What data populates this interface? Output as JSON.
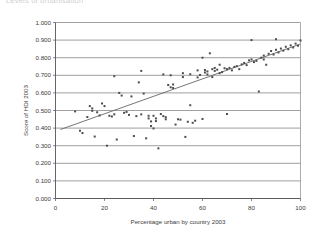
{
  "chart_data": {
    "type": "scatter",
    "title": "Levels of urbanisation",
    "xlabel": "Percentage urban by country 2003",
    "ylabel": "Score of HDI 2003",
    "xlim": [
      0,
      100
    ],
    "ylim": [
      0.0,
      1.0
    ],
    "xticks": [
      "0",
      "20",
      "40",
      "60",
      "80",
      "100"
    ],
    "xtick_values": [
      0,
      20,
      40,
      60,
      80,
      100
    ],
    "yticks": [
      "0.000",
      "0.100",
      "0.200",
      "0.300",
      "0.400",
      "0.500",
      "0.600",
      "0.700",
      "0.800",
      "0.900",
      "1.000"
    ],
    "ytick_values": [
      0.0,
      0.1,
      0.2,
      0.3,
      0.4,
      0.5,
      0.6,
      0.7,
      0.8,
      0.9,
      1.0
    ],
    "grid": "horizontal",
    "legend": "none",
    "marker_color": "#4d4d4d",
    "marker_shape": "square",
    "trendline": {
      "type": "linear",
      "color": "#666666",
      "x_start": 2,
      "y_start": 0.392,
      "x_end": 100,
      "y_end": 0.878
    },
    "series": [
      {
        "name": "Countries",
        "points": [
          [
            8,
            0.495
          ],
          [
            10,
            0.385
          ],
          [
            11,
            0.372
          ],
          [
            13,
            0.463
          ],
          [
            14,
            0.525
          ],
          [
            15,
            0.512
          ],
          [
            15,
            0.498
          ],
          [
            16,
            0.352
          ],
          [
            17,
            0.49
          ],
          [
            18,
            0.472
          ],
          [
            19,
            0.54
          ],
          [
            20,
            0.525
          ],
          [
            21,
            0.3
          ],
          [
            22,
            0.47
          ],
          [
            23,
            0.466
          ],
          [
            24,
            0.478
          ],
          [
            24,
            0.695
          ],
          [
            25,
            0.335
          ],
          [
            26,
            0.6
          ],
          [
            27,
            0.585
          ],
          [
            28,
            0.487
          ],
          [
            29,
            0.492
          ],
          [
            30,
            0.475
          ],
          [
            31,
            0.58
          ],
          [
            32,
            0.355
          ],
          [
            33,
            0.468
          ],
          [
            34,
            0.66
          ],
          [
            35,
            0.725
          ],
          [
            35,
            0.478
          ],
          [
            36,
            0.596
          ],
          [
            37,
            0.342
          ],
          [
            38,
            0.47
          ],
          [
            38,
            0.455
          ],
          [
            39,
            0.438
          ],
          [
            39,
            0.412
          ],
          [
            40,
            0.398
          ],
          [
            40,
            0.47
          ],
          [
            41,
            0.455
          ],
          [
            41,
            0.44
          ],
          [
            42,
            0.285
          ],
          [
            43,
            0.48
          ],
          [
            44,
            0.705
          ],
          [
            44,
            0.468
          ],
          [
            45,
            0.462
          ],
          [
            45,
            0.45
          ],
          [
            46,
            0.645
          ],
          [
            47,
            0.632
          ],
          [
            47,
            0.7
          ],
          [
            48,
            0.648
          ],
          [
            48,
            0.628
          ],
          [
            49,
            0.42
          ],
          [
            50,
            0.45
          ],
          [
            51,
            0.448
          ],
          [
            52,
            0.712
          ],
          [
            52,
            0.69
          ],
          [
            53,
            0.35
          ],
          [
            54,
            0.436
          ],
          [
            55,
            0.53
          ],
          [
            55,
            0.706
          ],
          [
            56,
            0.43
          ],
          [
            57,
            0.442
          ],
          [
            58,
            0.728
          ],
          [
            58,
            0.688
          ],
          [
            59,
            0.702
          ],
          [
            60,
            0.8
          ],
          [
            60,
            0.452
          ],
          [
            61,
            0.73
          ],
          [
            61,
            0.716
          ],
          [
            62,
            0.722
          ],
          [
            62,
            0.705
          ],
          [
            63,
            0.825
          ],
          [
            64,
            0.69
          ],
          [
            64,
            0.735
          ],
          [
            65,
            0.742
          ],
          [
            65,
            0.725
          ],
          [
            66,
            0.732
          ],
          [
            67,
            0.76
          ],
          [
            67,
            0.712
          ],
          [
            68,
            0.718
          ],
          [
            69,
            0.74
          ],
          [
            70,
            0.48
          ],
          [
            70,
            0.735
          ],
          [
            71,
            0.742
          ],
          [
            72,
            0.728
          ],
          [
            73,
            0.748
          ],
          [
            74,
            0.752
          ],
          [
            75,
            0.735
          ],
          [
            76,
            0.762
          ],
          [
            77,
            0.77
          ],
          [
            78,
            0.758
          ],
          [
            79,
            0.785
          ],
          [
            80,
            0.9
          ],
          [
            80,
            0.79
          ],
          [
            81,
            0.775
          ],
          [
            82,
            0.782
          ],
          [
            83,
            0.608
          ],
          [
            84,
            0.8
          ],
          [
            85,
            0.812
          ],
          [
            85,
            0.79
          ],
          [
            86,
            0.76
          ],
          [
            87,
            0.822
          ],
          [
            88,
            0.838
          ],
          [
            89,
            0.818
          ],
          [
            90,
            0.905
          ],
          [
            90,
            0.845
          ],
          [
            91,
            0.83
          ],
          [
            92,
            0.852
          ],
          [
            93,
            0.84
          ],
          [
            94,
            0.862
          ],
          [
            95,
            0.848
          ],
          [
            96,
            0.87
          ],
          [
            97,
            0.858
          ],
          [
            98,
            0.88
          ],
          [
            99,
            0.868
          ],
          [
            100,
            0.898
          ]
        ]
      }
    ]
  }
}
